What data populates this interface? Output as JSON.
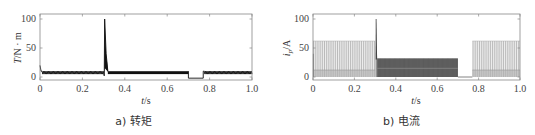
{
  "chart_data": [
    {
      "id": "a",
      "type": "line",
      "caption": "a) 转矩",
      "xlabel": "t/s",
      "ylabel": "T/N · m",
      "xlim": [
        0,
        1.0
      ],
      "ylim": [
        -5,
        110
      ],
      "xticks": [
        "0",
        "0.2",
        "0.4",
        "0.6",
        "0.8",
        "1.0"
      ],
      "yticks": [
        "0",
        "50",
        "100"
      ],
      "grid": false,
      "series": [
        {
          "name": "torque",
          "color": "#111111",
          "description": "Startup transient ~20 at t=0, steady ripple 5–10 until 0.30 s, spike to 100 at ~0.305 s decaying to ~10 by 0.32 s, dense ripple 5–10 until 0.70 s, drops to ~-2 during 0.70–0.77 s, ripple 5–10 resumes until 1.0 s",
          "x": [
            0,
            0.005,
            0.01,
            0.3,
            0.303,
            0.305,
            0.31,
            0.32,
            0.7,
            0.701,
            0.77,
            0.771,
            1.0
          ],
          "y": [
            20,
            10,
            8,
            8,
            5,
            100,
            40,
            10,
            8,
            -2,
            -2,
            8,
            8
          ],
          "ripple": {
            "low": 5,
            "high": 10
          }
        }
      ]
    },
    {
      "id": "b",
      "type": "line",
      "caption": "b) 电流",
      "xlabel": "t/s",
      "ylabel": "i_p/A",
      "xlim": [
        0,
        1.0
      ],
      "ylim": [
        -5,
        110
      ],
      "xticks": [
        "0",
        "0.2",
        "0.4",
        "0.6",
        "0.8",
        "1.0"
      ],
      "yticks": [
        "0",
        "50",
        "100"
      ],
      "grid": false,
      "series": [
        {
          "name": "phase current",
          "color": "#777777",
          "description": "PWM pulses up to ~62 A with base band ~12 A during 0–0.30 s, spike to 100 A at ~0.305 s, dense band up to ~32 A during 0.31–0.70 s, zero during 0.70–0.77 s, pulses up to ~62 A with base ~12 A during 0.77–1.0 s",
          "segments": [
            {
              "t_start": 0.0,
              "t_end": 0.3,
              "peak": 62,
              "base": 12
            },
            {
              "t_start": 0.303,
              "t_end": 0.31,
              "peak": 100,
              "base": 0
            },
            {
              "t_start": 0.31,
              "t_end": 0.7,
              "peak": 32,
              "base": 0
            },
            {
              "t_start": 0.7,
              "t_end": 0.77,
              "peak": 0,
              "base": 0
            },
            {
              "t_start": 0.77,
              "t_end": 1.0,
              "peak": 62,
              "base": 12
            }
          ]
        }
      ]
    }
  ],
  "panels": {
    "a": {
      "caption": "a) 转矩",
      "ylabel_main": "T",
      "ylabel_unit": "/N · m",
      "xlabel_main": "t",
      "xlabel_unit": "/s"
    },
    "b": {
      "caption": "b) 电流",
      "ylabel_main": "i",
      "ylabel_sub": "p",
      "ylabel_unit": "/A",
      "xlabel_main": "t",
      "xlabel_unit": "/s"
    }
  },
  "ticks": {
    "x": [
      "0",
      "0.2",
      "0.4",
      "0.6",
      "0.8",
      "1.0"
    ],
    "y": [
      "0",
      "50",
      "100"
    ]
  }
}
